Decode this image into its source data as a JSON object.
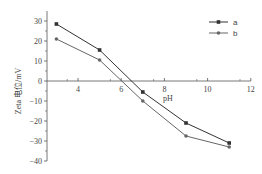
{
  "chart_data": {
    "type": "line",
    "title": "",
    "xlabel": "pH",
    "ylabel": "Zeta 电位/mV",
    "x": [
      3,
      5,
      7,
      9,
      11
    ],
    "series": [
      {
        "name": "a",
        "values": [
          28.5,
          15.5,
          -5.5,
          -21,
          -31
        ],
        "color": "#333333",
        "marker": "square"
      },
      {
        "name": "b",
        "values": [
          21,
          10.5,
          -10,
          -27.5,
          -33
        ],
        "color": "#666666",
        "marker": "circle"
      }
    ],
    "xticks": [
      "4",
      "6",
      "8",
      "10",
      "12"
    ],
    "yticks": [
      "30",
      "20",
      "10",
      "0",
      "-10",
      "-20",
      "-30",
      "-40"
    ],
    "xlim": [
      2.5,
      12
    ],
    "ylim": [
      -40,
      35
    ],
    "grid": false,
    "legend_position": "upper right"
  }
}
